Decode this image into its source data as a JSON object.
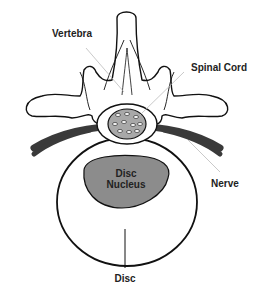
{
  "diagram": {
    "labels": {
      "vertebra": "Vertebra",
      "spinal_cord": "Spinal Cord",
      "nerve": "Nerve",
      "disc_nucleus_line1": "Disc",
      "disc_nucleus_line2": "Nucleus",
      "disc": "Disc"
    },
    "colors": {
      "outline": "#111111",
      "nerve": "#3a3a3a",
      "nucleus_fill": "#8c8c8c",
      "cord_fill": "#a8a8a8",
      "leader_line": "#bbbbbb",
      "background": "#ffffff"
    }
  }
}
